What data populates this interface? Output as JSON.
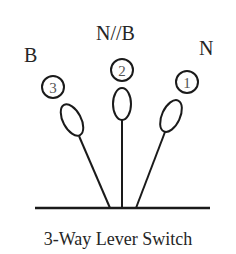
{
  "diagram": {
    "caption": "3-Way Lever Switch",
    "positions": [
      {
        "id": "position-3",
        "label": "B",
        "number": "3"
      },
      {
        "id": "position-2",
        "label": "N//B",
        "number": "2"
      },
      {
        "id": "position-1",
        "label": "N",
        "number": "1"
      }
    ],
    "colors": {
      "line": "#1a1a1a",
      "text": "#262626",
      "number": "#555555",
      "background": "#ffffff"
    }
  }
}
